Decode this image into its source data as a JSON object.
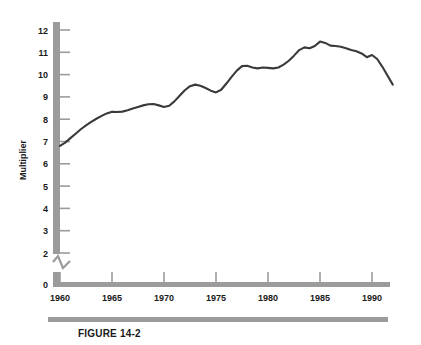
{
  "figure": {
    "caption": "FIGURE 14-2",
    "accent_color": "#9b9b9b",
    "line_color": "#3a3a3a",
    "text_color": "#1a1a1a"
  },
  "chart_data": {
    "type": "line",
    "title": "",
    "xlabel": "",
    "ylabel": "Multiplier",
    "xlim": [
      1960,
      1992.5
    ],
    "ylim": [
      0,
      12.5
    ],
    "y_axis_break": true,
    "y_break_between": [
      0,
      2
    ],
    "grid": false,
    "legend": "none",
    "ytick_labels": [
      "12",
      "11",
      "10",
      "9",
      "8",
      "7",
      "6",
      "5",
      "4",
      "3",
      "2",
      "0"
    ],
    "ytick_values": [
      12,
      11,
      10,
      9,
      8,
      7,
      6,
      5,
      4,
      3,
      2,
      0
    ],
    "xtick_labels": [
      "1960",
      "1965",
      "1970",
      "1975",
      "1980",
      "1985",
      "1990"
    ],
    "xtick_values": [
      1960,
      1965,
      1970,
      1975,
      1980,
      1985,
      1990
    ],
    "series": [
      {
        "name": "Multiplier",
        "x": [
          1960,
          1960.5,
          1961,
          1961.5,
          1962,
          1962.5,
          1963,
          1963.5,
          1964,
          1964.5,
          1965,
          1965.5,
          1966,
          1966.5,
          1967,
          1967.5,
          1968,
          1968.5,
          1969,
          1969.5,
          1970,
          1970.5,
          1971,
          1971.5,
          1972,
          1972.5,
          1973,
          1973.5,
          1974,
          1974.5,
          1975,
          1975.5,
          1976,
          1976.5,
          1977,
          1977.5,
          1978,
          1978.5,
          1979,
          1979.5,
          1980,
          1980.5,
          1981,
          1981.5,
          1982,
          1982.5,
          1983,
          1983.5,
          1984,
          1984.5,
          1985,
          1985.5,
          1986,
          1986.5,
          1987,
          1987.5,
          1988,
          1988.5,
          1989,
          1989.5,
          1990,
          1990.5,
          1991,
          1991.5,
          1992
        ],
        "y": [
          6.8,
          6.95,
          7.15,
          7.35,
          7.55,
          7.72,
          7.88,
          8.02,
          8.15,
          8.26,
          8.33,
          8.32,
          8.34,
          8.4,
          8.48,
          8.55,
          8.62,
          8.67,
          8.68,
          8.62,
          8.55,
          8.6,
          8.8,
          9.05,
          9.3,
          9.48,
          9.55,
          9.5,
          9.4,
          9.28,
          9.2,
          9.32,
          9.6,
          9.9,
          10.18,
          10.38,
          10.4,
          10.32,
          10.28,
          10.32,
          10.3,
          10.28,
          10.32,
          10.45,
          10.62,
          10.85,
          11.1,
          11.22,
          11.18,
          11.28,
          11.48,
          11.42,
          11.3,
          11.28,
          11.25,
          11.18,
          11.1,
          11.05,
          10.95,
          10.78,
          10.88,
          10.7,
          10.35,
          9.95,
          9.55
        ]
      }
    ]
  },
  "axis": {
    "ylabel_text": "Multiplier"
  }
}
